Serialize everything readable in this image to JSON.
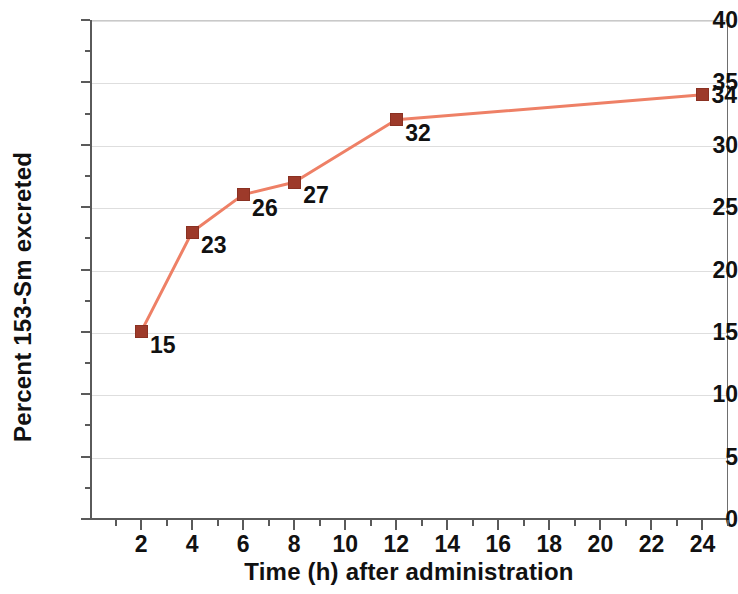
{
  "chart_data": {
    "type": "line",
    "title": "",
    "xlabel": "Time (h) after administration",
    "ylabel": "Percent 153-Sm excreted",
    "x": [
      2,
      4,
      6,
      8,
      12,
      24
    ],
    "values": [
      15,
      23,
      26,
      27,
      32,
      34
    ],
    "point_labels": [
      "15",
      "23",
      "26",
      "27",
      "32",
      "34"
    ],
    "series": [
      {
        "name": "Percent 153-Sm excreted",
        "x": [
          2,
          4,
          6,
          8,
          12,
          24
        ],
        "values": [
          15,
          23,
          26,
          27,
          32,
          34
        ],
        "line_color": "#ee8066",
        "marker_color": "#9d3a2a",
        "marker": "square"
      }
    ],
    "xlim": [
      0,
      25
    ],
    "ylim": [
      0,
      40
    ],
    "x_ticks": [
      2,
      4,
      6,
      8,
      10,
      12,
      14,
      16,
      18,
      20,
      22,
      24
    ],
    "x_tick_labels": [
      "2",
      "4",
      "6",
      "8",
      "10",
      "12",
      "14",
      "16",
      "18",
      "20",
      "22",
      "24"
    ],
    "x_minor_ticks": [
      1,
      3,
      5,
      7,
      9,
      11,
      13,
      15,
      17,
      19,
      21,
      23,
      25
    ],
    "y_ticks": [
      0,
      5,
      10,
      15,
      20,
      25,
      30,
      35,
      40
    ],
    "y_tick_labels": [
      "0",
      "5",
      "10",
      "15",
      "20",
      "25",
      "30",
      "35",
      "40"
    ],
    "y_minor_ticks": [
      2.5,
      7.5,
      12.5,
      17.5,
      22.5,
      27.5,
      32.5,
      37.5
    ],
    "grid": "horizontal",
    "grid_color": "#dedede",
    "legend": "none",
    "background_color": "#ffffff",
    "axis_color": "#5a5a5a",
    "text_color": "#111111"
  }
}
